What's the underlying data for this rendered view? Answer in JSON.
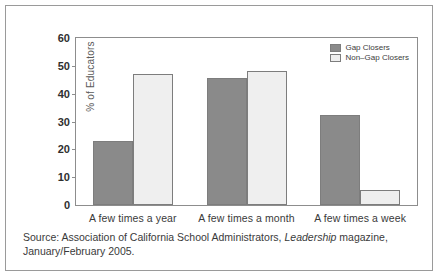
{
  "chart_data": {
    "type": "bar",
    "title": "",
    "subtitle": "",
    "xlabel": "",
    "ylabel": "% of Educators",
    "ylim": [
      0,
      60
    ],
    "yticks": [
      0,
      10,
      20,
      30,
      40,
      50,
      60
    ],
    "ytick_labels": [
      "0",
      "10",
      "20",
      "30",
      "40",
      "50",
      "60"
    ],
    "grid": false,
    "legend_position": "top-right",
    "categories": [
      "A few times a year",
      "A few times a month",
      "A few times a week"
    ],
    "series": [
      {
        "name": "Gap Closers",
        "color": "#8a8a8a",
        "values": [
          23,
          45.5,
          32.5
        ]
      },
      {
        "name": "Non–Gap Closers",
        "color": "#efefef",
        "values": [
          47,
          48,
          5.5
        ]
      }
    ]
  },
  "legend": {
    "entries": [
      {
        "label": "Gap Closers"
      },
      {
        "label": "Non–Gap Closers"
      }
    ]
  },
  "source": {
    "line1_before_italic": "Source: Association of California School Administrators, ",
    "line1_italic": "Leadership",
    "line1_after_italic": " magazine,",
    "line2": "January/February 2005."
  }
}
